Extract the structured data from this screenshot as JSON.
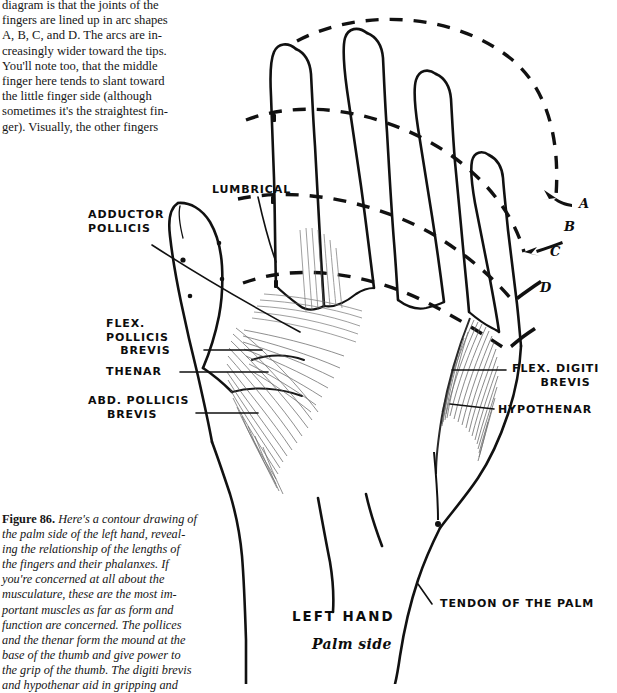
{
  "page": {
    "background_color": "#ffffff",
    "ink_color": "#0d0d0d"
  },
  "top_text": {
    "lines": [
      "diagram is that the joints of the",
      "fingers are lined up in arc shapes",
      "A, B, C, and D. The arcs are in-",
      "creasingly wider toward the tips.",
      "You'll note too, that the middle",
      "finger here tends to slant toward",
      "the little finger side (although",
      "sometimes it's the straightest fin-",
      "ger). Visually, the other fingers"
    ]
  },
  "caption": {
    "figure_number": "Figure 86.",
    "lines": [
      " Here's a contour drawing of",
      "the palm side of the left hand, reveal-",
      "ing the relationship of the lengths of",
      "the fingers and their phalanxes. If",
      "you're concerned at all about the",
      "musculature, these are the most im-",
      "portant muscles as far as form and",
      "function are concerned. The pollices",
      "and the thenar form the mound at the",
      "base of the thumb and give power to",
      "the grip of the thumb. The digiti brevis",
      "and hypothenar aid in gripping and"
    ]
  },
  "diagram": {
    "title": "LEFT HAND",
    "subtitle": "Palm side",
    "arc_labels": [
      {
        "id": "A",
        "label": "A"
      },
      {
        "id": "B",
        "label": "B"
      },
      {
        "id": "C",
        "label": "C"
      },
      {
        "id": "D",
        "label": "D"
      }
    ],
    "muscle_labels": [
      {
        "id": "lumbrical",
        "label": "LUMBRICAL"
      },
      {
        "id": "adductor-pollicis",
        "label": "ADDUCTOR\nPOLLICIS"
      },
      {
        "id": "flexor-pollicis-brevis",
        "label": "FLEX.\nPOLLICIS\n   BREVIS"
      },
      {
        "id": "thenar",
        "label": "THENAR"
      },
      {
        "id": "abductor-pollicis-brevis",
        "label": "ABD. POLLICIS\n    BREVIS"
      },
      {
        "id": "flexor-digiti-brevis",
        "label": "FLEX. DIGITI\n      BREVIS"
      },
      {
        "id": "hypothenar",
        "label": "HYPOTHENAR"
      },
      {
        "id": "tendon-of-the-palm",
        "label": "TENDON OF THE PALM"
      }
    ]
  }
}
